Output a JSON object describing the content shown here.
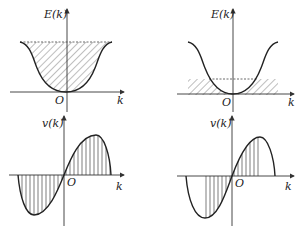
{
  "figure": {
    "panels": [
      {
        "id": "top-left",
        "ylabel": "E(k)",
        "xlabel": "k",
        "origin": "O",
        "curve": "energy band E(k), band shape with minimum at k=0",
        "shading": "diagonal hatching, band fully filled"
      },
      {
        "id": "top-right",
        "ylabel": "E(k)",
        "xlabel": "k",
        "origin": "O",
        "curve": "energy band E(k), band shape with minimum at k=0",
        "shading": "diagonal hatching, only near band bottom"
      },
      {
        "id": "bottom-left",
        "ylabel": "v(k)",
        "xlabel": "k",
        "origin": "O",
        "curve": "electron velocity v(k), odd function",
        "shading": "vertical hatching, over whole zone"
      },
      {
        "id": "bottom-right",
        "ylabel": "v(k)",
        "xlabel": "k",
        "origin": "O",
        "curve": "electron velocity v(k), odd function",
        "shading": "vertical hatching, only central region"
      }
    ]
  },
  "colors": {
    "ink": "#222222",
    "background": "#ffffff"
  }
}
